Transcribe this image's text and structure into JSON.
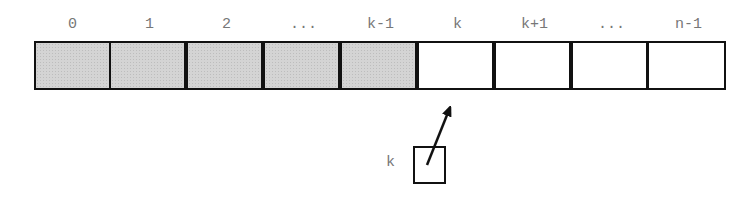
{
  "array": {
    "indices": [
      "0",
      "1",
      "2",
      "...",
      "k-1",
      "k",
      "k+1",
      "...",
      "n-1"
    ],
    "cells": [
      {
        "state": "filled"
      },
      {
        "state": "filled"
      },
      {
        "state": "filled"
      },
      {
        "state": "filled"
      },
      {
        "state": "filled"
      },
      {
        "state": "empty"
      },
      {
        "state": "empty"
      },
      {
        "state": "empty"
      },
      {
        "state": "empty"
      }
    ],
    "filled_color": "#d4d4d4",
    "empty_color": "#ffffff",
    "border_color": "#111111"
  },
  "pointer": {
    "label": "k",
    "target_index": "k"
  }
}
